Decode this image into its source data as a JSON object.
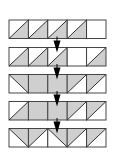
{
  "diagram": {
    "colors": {
      "fill": "#cfcfcf",
      "stroke": "#333333",
      "background": "#ffffff"
    },
    "layout": {
      "left": 9,
      "cell_width": 19.4,
      "cell_height": 18.5,
      "row_tops": [
        20,
        47.5,
        74.5,
        101.5,
        128.5
      ],
      "arrow_x": 57
    },
    "legend": {
      "BR": "diagonal bottom-left to top-right, lower-right half shaded",
      "TL": "diagonal bottom-left to top-right, upper-left half shaded",
      "TR": "diagonal top-left to bottom-right, upper-right half shaded",
      "FULL": "fully shaded",
      "EMPTY": "unshaded"
    },
    "rows": [
      [
        "BR",
        "BR",
        "BR",
        "BR",
        "EMPTY"
      ],
      [
        "BR",
        "BR",
        "BR",
        "EMPTY",
        "BR"
      ],
      [
        "TR",
        "FULL",
        "FULL",
        "TL",
        "TL"
      ],
      [
        "BR",
        "FULL",
        "FULL",
        "TL",
        "TL"
      ],
      [
        "TR",
        "TL",
        "TR",
        "TL",
        "TL"
      ]
    ],
    "arrows": [
      {
        "from_row": 1,
        "to_row": 2
      },
      {
        "from_row": 2,
        "to_row": 3
      },
      {
        "from_row": 3,
        "to_row": 4
      },
      {
        "from_row": 4,
        "to_row": 5
      }
    ]
  }
}
